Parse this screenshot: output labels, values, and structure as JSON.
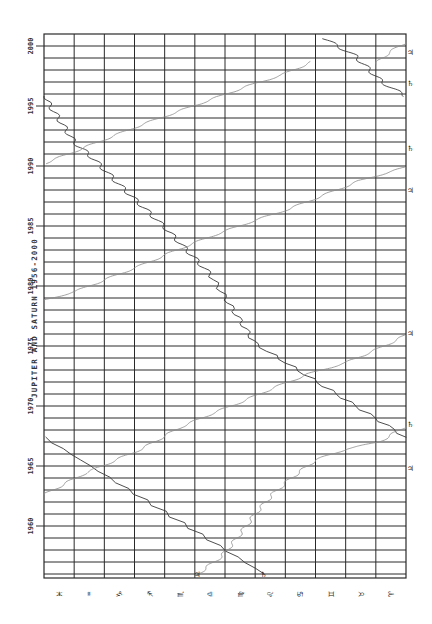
{
  "chart_data": {
    "type": "line",
    "orientation": "rotated-90",
    "title": "JUPITER AND SATURN 1956-2000",
    "xlabel": "Year",
    "ylabel": "Zodiac longitude",
    "year_range": [
      1955.67,
      2001
    ],
    "year_ticks": [
      "1960",
      "1965",
      "1970",
      "1975",
      "1980",
      "1985",
      "1990",
      "1995",
      "2000"
    ],
    "year_tick_values": [
      1960,
      1965,
      1970,
      1975,
      1980,
      1985,
      1990,
      1995,
      2000
    ],
    "sign_labels": [
      "♓",
      "♒",
      "♑",
      "♐",
      "♏",
      "♎",
      "♍",
      "♌",
      "♋",
      "♊",
      "♉",
      "♈"
    ],
    "sign_names": [
      "Pisces",
      "Aquarius",
      "Capricorn",
      "Sagittarius",
      "Scorpio",
      "Libra",
      "Virgo",
      "Leo",
      "Cancer",
      "Gemini",
      "Taurus",
      "Aries"
    ],
    "grid": true,
    "grid_columns": 12,
    "grid_rows_per_year": 1,
    "series": [
      {
        "name": "Steep series (darker)",
        "color": "#3a3a3a",
        "width": 0.9,
        "wiggle": 3.2,
        "segments": [
          [
            [
              1956.0,
              7.3
            ],
            [
              1967.4,
              0.0
            ]
          ],
          [
            [
              1967.4,
              12.0
            ],
            [
              1975.2,
              7.0
            ],
            [
              1981.0,
              5.5
            ],
            [
              1984.9,
              4.0
            ],
            [
              1988.2,
              2.6
            ],
            [
              1990.7,
              1.6
            ],
            [
              1992.0,
              1.0
            ],
            [
              1995.8,
              0.0
            ]
          ],
          [
            [
              1995.8,
              12.0
            ],
            [
              1997.0,
              11.2
            ],
            [
              1999.2,
              10.3
            ],
            [
              2000.6,
              9.3
            ]
          ]
        ]
      },
      {
        "name": "Shallow series (lighter)",
        "color": "#8a8a8a",
        "width": 0.8,
        "wiggle": 2.6,
        "segments": [
          [
            [
              1956.0,
              5.1
            ],
            [
              1957.5,
              5.9
            ],
            [
              1959.0,
              6.4
            ],
            [
              1961.0,
              7.0
            ],
            [
              1962.7,
              7.6
            ],
            [
              1964.0,
              8.2
            ],
            [
              1965.5,
              9.0
            ],
            [
              1966.4,
              10.0
            ],
            [
              1967.0,
              11.1
            ],
            [
              1968.3,
              12.0
            ]
          ],
          [
            [
              1962.6,
              0.0
            ],
            [
              1964.2,
              1.2
            ],
            [
              1965.3,
              2.2
            ],
            [
              1966.5,
              3.3
            ],
            [
              1968.2,
              4.5
            ],
            [
              1969.3,
              5.5
            ],
            [
              1970.4,
              6.6
            ],
            [
              1971.5,
              7.6
            ],
            [
              1972.7,
              8.8
            ],
            [
              1973.6,
              10.0
            ],
            [
              1974.9,
              11.2
            ],
            [
              1975.9,
              12.0
            ]
          ],
          [
            [
              1978.8,
              0.0
            ],
            [
              1979.6,
              1.1
            ],
            [
              1980.7,
              2.2
            ],
            [
              1981.8,
              3.3
            ],
            [
              1983.0,
              4.4
            ],
            [
              1984.2,
              5.6
            ],
            [
              1985.3,
              6.8
            ],
            [
              1986.4,
              8.1
            ],
            [
              1987.6,
              9.3
            ],
            [
              1988.8,
              10.5
            ],
            [
              1989.9,
              12.0
            ]
          ],
          [
            [
              1990.2,
              0.0
            ],
            [
              1991.3,
              1.1
            ],
            [
              1992.4,
              2.2
            ],
            [
              1993.5,
              3.3
            ],
            [
              1994.5,
              4.4
            ],
            [
              1995.6,
              5.6
            ],
            [
              1996.7,
              6.8
            ],
            [
              1997.6,
              7.9
            ],
            [
              1998.7,
              8.9
            ]
          ],
          [
            [
              1998.5,
              11.0
            ],
            [
              1999.4,
              11.4
            ],
            [
              2000.3,
              12.0
            ]
          ]
        ]
      }
    ],
    "wrap_markers": [
      {
        "year": 1956.0,
        "col": 7.3,
        "symbol": "♄"
      },
      {
        "year": 1956.0,
        "col": 5.1,
        "symbol": "♃"
      },
      {
        "year": 1964.8,
        "col": 12.0,
        "symbol": "♃"
      },
      {
        "year": 1968.5,
        "col": 12.0,
        "symbol": "♄"
      },
      {
        "year": 1976.1,
        "col": 12.0,
        "symbol": "♃"
      },
      {
        "year": 1988.0,
        "col": 12.0,
        "symbol": "♃"
      },
      {
        "year": 1991.5,
        "col": 12.0,
        "symbol": "♄"
      },
      {
        "year": 1996.9,
        "col": 12.0,
        "symbol": "♄"
      },
      {
        "year": 1999.5,
        "col": 12.0,
        "symbol": "♃"
      }
    ]
  },
  "layout": {
    "grid_left": 44,
    "grid_right": 406,
    "grid_top": 34,
    "grid_bottom": 578,
    "px_per_year": 12,
    "year_at_46": 2000
  }
}
